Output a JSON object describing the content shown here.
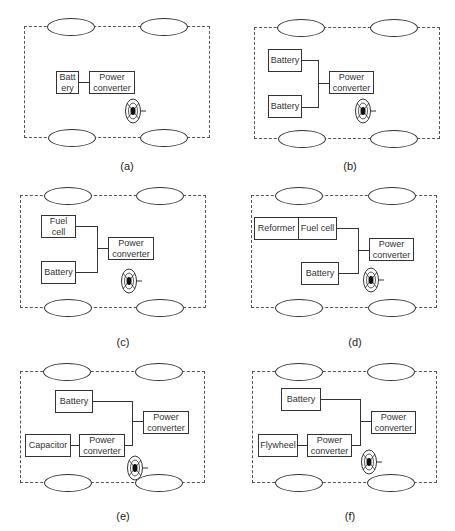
{
  "figure": {
    "panels": [
      {
        "id": "a",
        "caption": "(a)",
        "boxes": {
          "battery": "Batt\nery",
          "converter": "Power\nconverter"
        }
      },
      {
        "id": "b",
        "caption": "(b)",
        "boxes": {
          "battery1": "Battery",
          "battery2": "Battery",
          "converter": "Power\nconverter"
        }
      },
      {
        "id": "c",
        "caption": "(c)",
        "boxes": {
          "fuelcell": "Fuel\ncell",
          "battery": "Battery",
          "converter": "Power\nconverter"
        }
      },
      {
        "id": "d",
        "caption": "(d)",
        "boxes": {
          "reformer": "Reformer",
          "fuelcell": "Fuel cell",
          "battery": "Battery",
          "converter": "Power\nconverter"
        }
      },
      {
        "id": "e",
        "caption": "(e)",
        "boxes": {
          "battery": "Battery",
          "capacitor": "Capacitor",
          "converter_small": "Power\nconverter",
          "converter": "Power\nconverter"
        }
      },
      {
        "id": "f",
        "caption": "(f)",
        "boxes": {
          "battery": "Battery",
          "flywheel": "Flywheel",
          "converter_small": "Power\nconverter",
          "converter": "Power\nconverter"
        }
      }
    ]
  },
  "colors": {
    "stroke": "#333333",
    "dash": "#555555",
    "background": "#ffffff"
  }
}
